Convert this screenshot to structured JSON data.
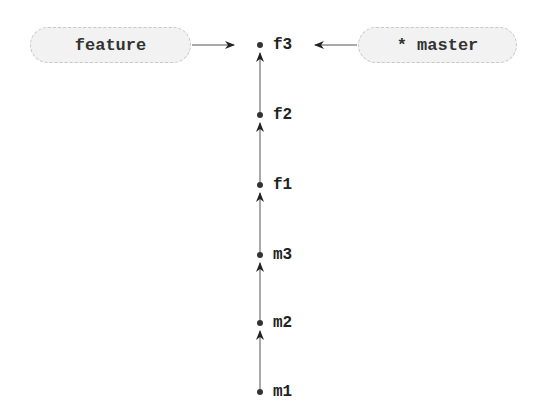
{
  "diagram": {
    "type": "git-commit-graph",
    "branches": [
      {
        "name": "feature",
        "label": "feature",
        "points_to": "f3",
        "current": false
      },
      {
        "name": "master",
        "label": "* master",
        "points_to": "f3",
        "current": true
      }
    ],
    "commits": [
      {
        "id": "f3",
        "label": "f3"
      },
      {
        "id": "f2",
        "label": "f2"
      },
      {
        "id": "f1",
        "label": "f1"
      },
      {
        "id": "m3",
        "label": "m3"
      },
      {
        "id": "m2",
        "label": "m2"
      },
      {
        "id": "m1",
        "label": "m1"
      }
    ],
    "colors": {
      "pill_fill": "#f2f2f2",
      "pill_border": "#c8c8c8",
      "line": "#333333"
    }
  }
}
